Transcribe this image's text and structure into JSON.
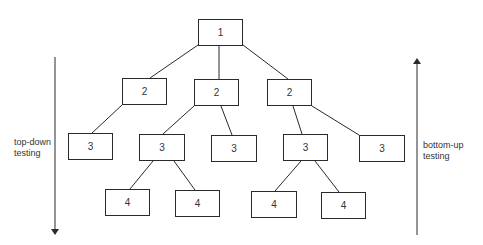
{
  "diagram": {
    "type": "tree",
    "nodes": [
      {
        "id": "n1",
        "label": "1",
        "level": 1,
        "x": 198,
        "y": 19,
        "w": 45,
        "h": 27
      },
      {
        "id": "n2a",
        "label": "2",
        "level": 2,
        "x": 122,
        "y": 78,
        "w": 45,
        "h": 27
      },
      {
        "id": "n2b",
        "label": "2",
        "level": 2,
        "x": 194,
        "y": 79,
        "w": 45,
        "h": 27
      },
      {
        "id": "n2c",
        "label": "2",
        "level": 2,
        "x": 267,
        "y": 79,
        "w": 45,
        "h": 27
      },
      {
        "id": "n3a",
        "label": "3",
        "level": 3,
        "x": 68,
        "y": 133,
        "w": 45,
        "h": 27
      },
      {
        "id": "n3b",
        "label": "3",
        "level": 3,
        "x": 139,
        "y": 134,
        "w": 46,
        "h": 27
      },
      {
        "id": "n3c",
        "label": "3",
        "level": 3,
        "x": 211,
        "y": 135,
        "w": 46,
        "h": 27
      },
      {
        "id": "n3d",
        "label": "3",
        "level": 3,
        "x": 283,
        "y": 134,
        "w": 45,
        "h": 27
      },
      {
        "id": "n3e",
        "label": "3",
        "level": 3,
        "x": 359,
        "y": 135,
        "w": 46,
        "h": 27
      },
      {
        "id": "n4a",
        "label": "4",
        "level": 4,
        "x": 105,
        "y": 189,
        "w": 45,
        "h": 27
      },
      {
        "id": "n4b",
        "label": "4",
        "level": 4,
        "x": 175,
        "y": 190,
        "w": 45,
        "h": 27
      },
      {
        "id": "n4c",
        "label": "4",
        "level": 4,
        "x": 251,
        "y": 191,
        "w": 46,
        "h": 27
      },
      {
        "id": "n4d",
        "label": "4",
        "level": 4,
        "x": 321,
        "y": 192,
        "w": 45,
        "h": 27
      }
    ],
    "edges": [
      {
        "from": "n1",
        "to": "n2a",
        "x1": 198,
        "y1": 45,
        "x2": 150,
        "y2": 78
      },
      {
        "from": "n1",
        "to": "n2b",
        "x1": 219,
        "y1": 45,
        "x2": 219,
        "y2": 79
      },
      {
        "from": "n1",
        "to": "n2c",
        "x1": 243,
        "y1": 45,
        "x2": 288,
        "y2": 79
      },
      {
        "from": "n2a",
        "to": "n3a",
        "x1": 122,
        "y1": 105,
        "x2": 92,
        "y2": 133
      },
      {
        "from": "n2b",
        "to": "n3b",
        "x1": 194,
        "y1": 106,
        "x2": 163,
        "y2": 134
      },
      {
        "from": "n2b",
        "to": "n3c",
        "x1": 221,
        "y1": 106,
        "x2": 232,
        "y2": 135
      },
      {
        "from": "n2c",
        "to": "n3d",
        "x1": 293,
        "y1": 106,
        "x2": 302,
        "y2": 134
      },
      {
        "from": "n2c",
        "to": "n3e",
        "x1": 312,
        "y1": 106,
        "x2": 359,
        "y2": 135
      },
      {
        "from": "n3b",
        "to": "n4a",
        "x1": 153,
        "y1": 161,
        "x2": 130,
        "y2": 189
      },
      {
        "from": "n3b",
        "to": "n4b",
        "x1": 174,
        "y1": 161,
        "x2": 195,
        "y2": 190
      },
      {
        "from": "n3d",
        "to": "n4c",
        "x1": 301,
        "y1": 161,
        "x2": 275,
        "y2": 191
      },
      {
        "from": "n3d",
        "to": "n4d",
        "x1": 315,
        "y1": 161,
        "x2": 339,
        "y2": 192
      }
    ],
    "arrows": [
      {
        "id": "top-down",
        "x": 55,
        "y_start": 57,
        "y_end": 232,
        "direction": "down"
      },
      {
        "id": "bottom-up",
        "x": 417,
        "y_start": 235,
        "y_end": 61,
        "direction": "up"
      }
    ],
    "labels": {
      "top_down_line1": "top-down",
      "top_down_line2": "testing",
      "bottom_up_line1": "bottom-up",
      "bottom_up_line2": "testing"
    },
    "colors": {
      "stroke": "#2a2a2a",
      "text": "#333333",
      "background": "#ffffff"
    }
  }
}
